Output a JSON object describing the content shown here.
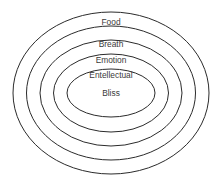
{
  "diagram": {
    "type": "concentric-ellipses",
    "background_color": "#ffffff",
    "stroke_color": "#2b2b2b",
    "text_color": "#3a3a3a",
    "center": {
      "x": 111,
      "y": 93
    },
    "layers": [
      {
        "label": "Food",
        "rx": 98,
        "ry": 81,
        "label_x": 111,
        "label_y": 23
      },
      {
        "label": "Breath",
        "rx": 84.5,
        "ry": 67,
        "label_x": 111,
        "label_y": 45
      },
      {
        "label": "Emotion",
        "rx": 71,
        "ry": 53,
        "label_x": 111,
        "label_y": 61
      },
      {
        "label": "Entellectual",
        "rx": 57.5,
        "ry": 39,
        "label_x": 111,
        "label_y": 76
      },
      {
        "label": "Bliss",
        "rx": 44,
        "ry": 24,
        "label_x": 111,
        "label_y": 94
      }
    ]
  }
}
